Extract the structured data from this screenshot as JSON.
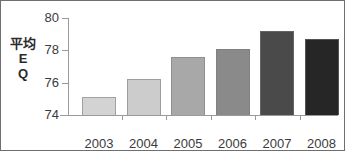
{
  "chart_data": {
    "type": "bar",
    "title": "",
    "subtitle": "",
    "xlabel": "",
    "ylabel": "平均\nE\nQ",
    "ylabel_lines": [
      "平均",
      "E",
      "Q"
    ],
    "categories": [
      "2003",
      "2004",
      "2005",
      "2006",
      "2007",
      "2008"
    ],
    "values": [
      75.1,
      76.2,
      77.6,
      78.1,
      79.2,
      78.7
    ],
    "ylim": [
      74,
      80
    ],
    "yticks": [
      74,
      76,
      78,
      80
    ],
    "ytick_labels": [
      "74",
      "76",
      "78",
      "80"
    ],
    "grid": false,
    "legend": false,
    "legend_position": "none",
    "bar_colors": [
      "#d3d3d3",
      "#cccccc",
      "#a8a8a8",
      "#8a8a8a",
      "#4a4a4a",
      "#262626"
    ],
    "axis_color": "#9a9a9a",
    "text_color": "#3b3b3b",
    "background": "#ffffff",
    "border_color": "#6f6f6f"
  }
}
